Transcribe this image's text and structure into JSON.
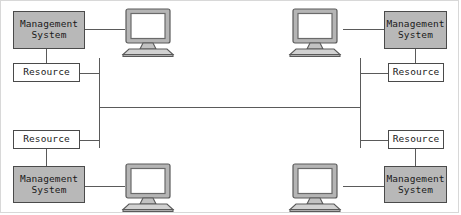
{
  "figure": {
    "background_color": "#ffffff",
    "border_color": "#d8d8d8",
    "line_color": "#5a5a5a",
    "management_box_fill": "#b8b8b8",
    "resource_box_fill": "#ffffff",
    "box_border_color": "#4a4a4a",
    "monitor_bezel_color": "#9a9a9a",
    "monitor_screen_color": "#ffffff"
  },
  "nodes": {
    "top_left": {
      "management_system": "Management\nSystem",
      "resource": "Resource",
      "monitor": "computer-monitor-icon"
    },
    "top_right": {
      "management_system": "Management\nSystem",
      "resource": "Resource",
      "monitor": "computer-monitor-icon"
    },
    "bottom_left": {
      "management_system": "Management\nSystem",
      "resource": "Resource",
      "monitor": "computer-monitor-icon"
    },
    "bottom_right": {
      "management_system": "Management\nSystem",
      "resource": "Resource",
      "monitor": "computer-monitor-icon"
    }
  },
  "bus": {
    "left_vertical_label": "left-bus-segment",
    "right_vertical_label": "right-bus-segment",
    "trunk_label": "horizontal-trunk-link"
  }
}
